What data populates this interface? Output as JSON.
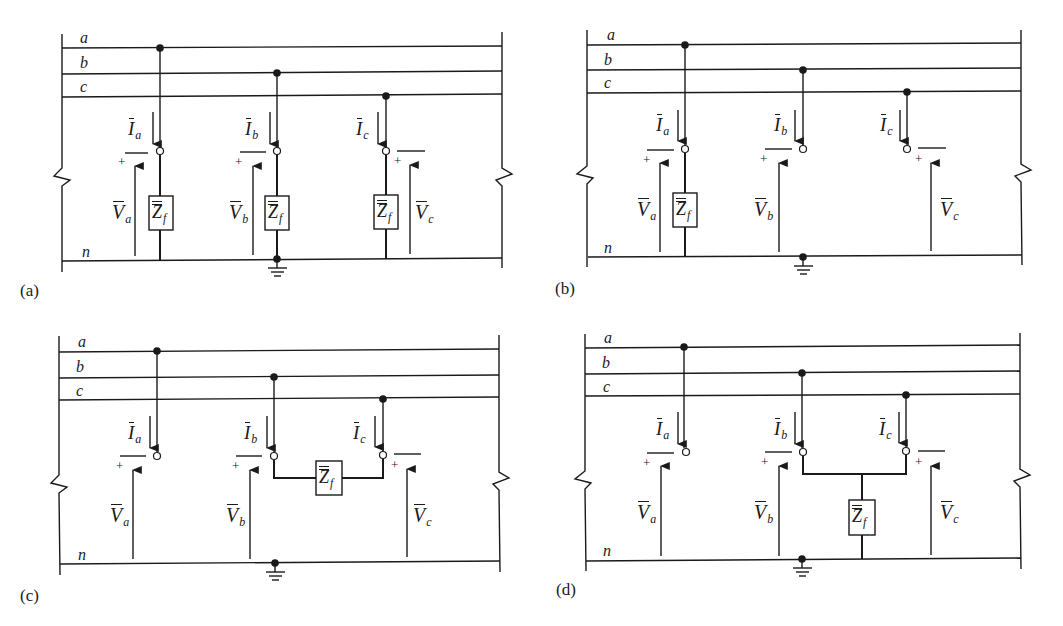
{
  "figure": {
    "bus_labels": [
      "a",
      "b",
      "c",
      "n"
    ],
    "impedance_label": "Z",
    "impedance_sub": "f",
    "current_labels": [
      {
        "main": "I",
        "sub": "a"
      },
      {
        "main": "I",
        "sub": "b"
      },
      {
        "main": "I",
        "sub": "c"
      }
    ],
    "voltage_labels": [
      {
        "main": "V",
        "sub": "a"
      },
      {
        "main": "V",
        "sub": "b"
      },
      {
        "main": "V",
        "sub": "c"
      }
    ],
    "polarity": {
      "plus": "+",
      "minus": "—"
    },
    "panels": [
      {
        "id": "a",
        "caption": "(a)",
        "fault": "three-phase-to-ground through Zf on each phase"
      },
      {
        "id": "b",
        "caption": "(b)",
        "fault": "single-line-to-ground on phase a through Zf"
      },
      {
        "id": "c",
        "caption": "(c)",
        "fault": "line-to-line between phases b and c through Zf"
      },
      {
        "id": "d",
        "caption": "(d)",
        "fault": "double-line-to-ground on phases b and c through Zf"
      }
    ]
  }
}
